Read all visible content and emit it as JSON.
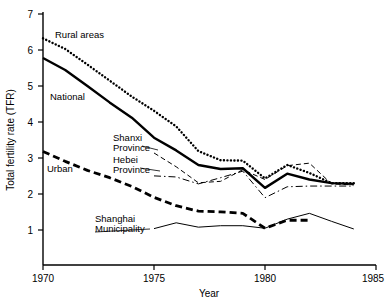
{
  "chart_data": {
    "type": "line",
    "title": "",
    "xlabel": "Year",
    "ylabel": "Total fertility rate (TFR)",
    "xlim": [
      1970,
      1985
    ],
    "ylim": [
      0.1,
      7
    ],
    "xticks": [
      1970,
      1975,
      1980,
      1985
    ],
    "yticks": [
      1,
      2,
      3,
      4,
      5,
      6,
      7
    ],
    "grid": false,
    "legend_position": "inline-annotations",
    "x": [
      1970,
      1971,
      1972,
      1973,
      1974,
      1975,
      1976,
      1977,
      1978,
      1979,
      1980,
      1981,
      1982,
      1983,
      1984
    ],
    "series": [
      {
        "name": "Rural areas",
        "style": "dotted",
        "values": [
          6.33,
          6.04,
          5.61,
          5.17,
          4.73,
          4.34,
          3.91,
          3.23,
          2.98,
          2.97,
          2.48,
          2.85,
          2.63,
          2.35,
          2.35
        ]
      },
      {
        "name": "National",
        "style": "solid-thick",
        "values": [
          5.79,
          5.46,
          5.02,
          4.57,
          4.15,
          3.6,
          3.25,
          2.85,
          2.74,
          2.76,
          2.22,
          2.61,
          2.45,
          2.35,
          2.33
        ]
      },
      {
        "name": "Shanxi Province",
        "style": "dashed-thin",
        "values": [
          null,
          null,
          null,
          null,
          null,
          3.18,
          2.8,
          2.36,
          2.4,
          2.72,
          2.45,
          2.83,
          2.9,
          2.33,
          2.3
        ]
      },
      {
        "name": "Hebei Province",
        "style": "dash-dot-thin",
        "values": [
          null,
          null,
          null,
          null,
          null,
          2.55,
          2.52,
          2.33,
          2.5,
          2.68,
          1.95,
          2.25,
          2.27,
          2.27,
          2.27
        ]
      },
      {
        "name": "Urban",
        "style": "dashed-thick",
        "values": [
          3.22,
          2.95,
          2.7,
          2.5,
          2.26,
          1.96,
          1.73,
          1.58,
          1.56,
          1.52,
          1.11,
          1.33,
          1.33,
          null,
          null
        ]
      },
      {
        "name": "Shanghai Municipality",
        "style": "solid-thin",
        "values": [
          null,
          null,
          null,
          null,
          null,
          1.1,
          1.26,
          1.14,
          1.18,
          1.18,
          1.11,
          1.36,
          1.52,
          1.3,
          1.09
        ]
      }
    ],
    "annotations": [
      {
        "label": "Rural areas",
        "series": "Rural areas"
      },
      {
        "label": "National",
        "series": "National"
      },
      {
        "label": "Shanxi",
        "series": "Shanxi Province"
      },
      {
        "label": "Province",
        "series": "Shanxi Province"
      },
      {
        "label": "Hebei",
        "series": "Hebei Province"
      },
      {
        "label": "Province",
        "series": "Hebei Province"
      },
      {
        "label": "Urban",
        "series": "Urban"
      },
      {
        "label": "Shanghai",
        "series": "Shanghai Municipality"
      },
      {
        "label": "Municipality",
        "series": "Shanghai Municipality"
      }
    ]
  },
  "axis": {
    "y_title": "Total fertility rate (TFR)",
    "x_title": "Year",
    "y_tick_labels": [
      "7",
      "6",
      "5",
      "4",
      "3",
      "2",
      "1"
    ],
    "x_tick_labels": [
      "1970",
      "1975",
      "1980",
      "1985"
    ]
  },
  "labels": {
    "rural": "Rural areas",
    "national": "National",
    "shanxi_line1": "Shanxi",
    "shanxi_line2": "Province",
    "hebei_line1": "Hebei",
    "hebei_line2": "Province",
    "urban": "Urban",
    "shanghai_line1": "Shanghai",
    "shanghai_line2": "Municipality"
  },
  "colors": {
    "ink": "#000000",
    "background": "#ffffff"
  }
}
